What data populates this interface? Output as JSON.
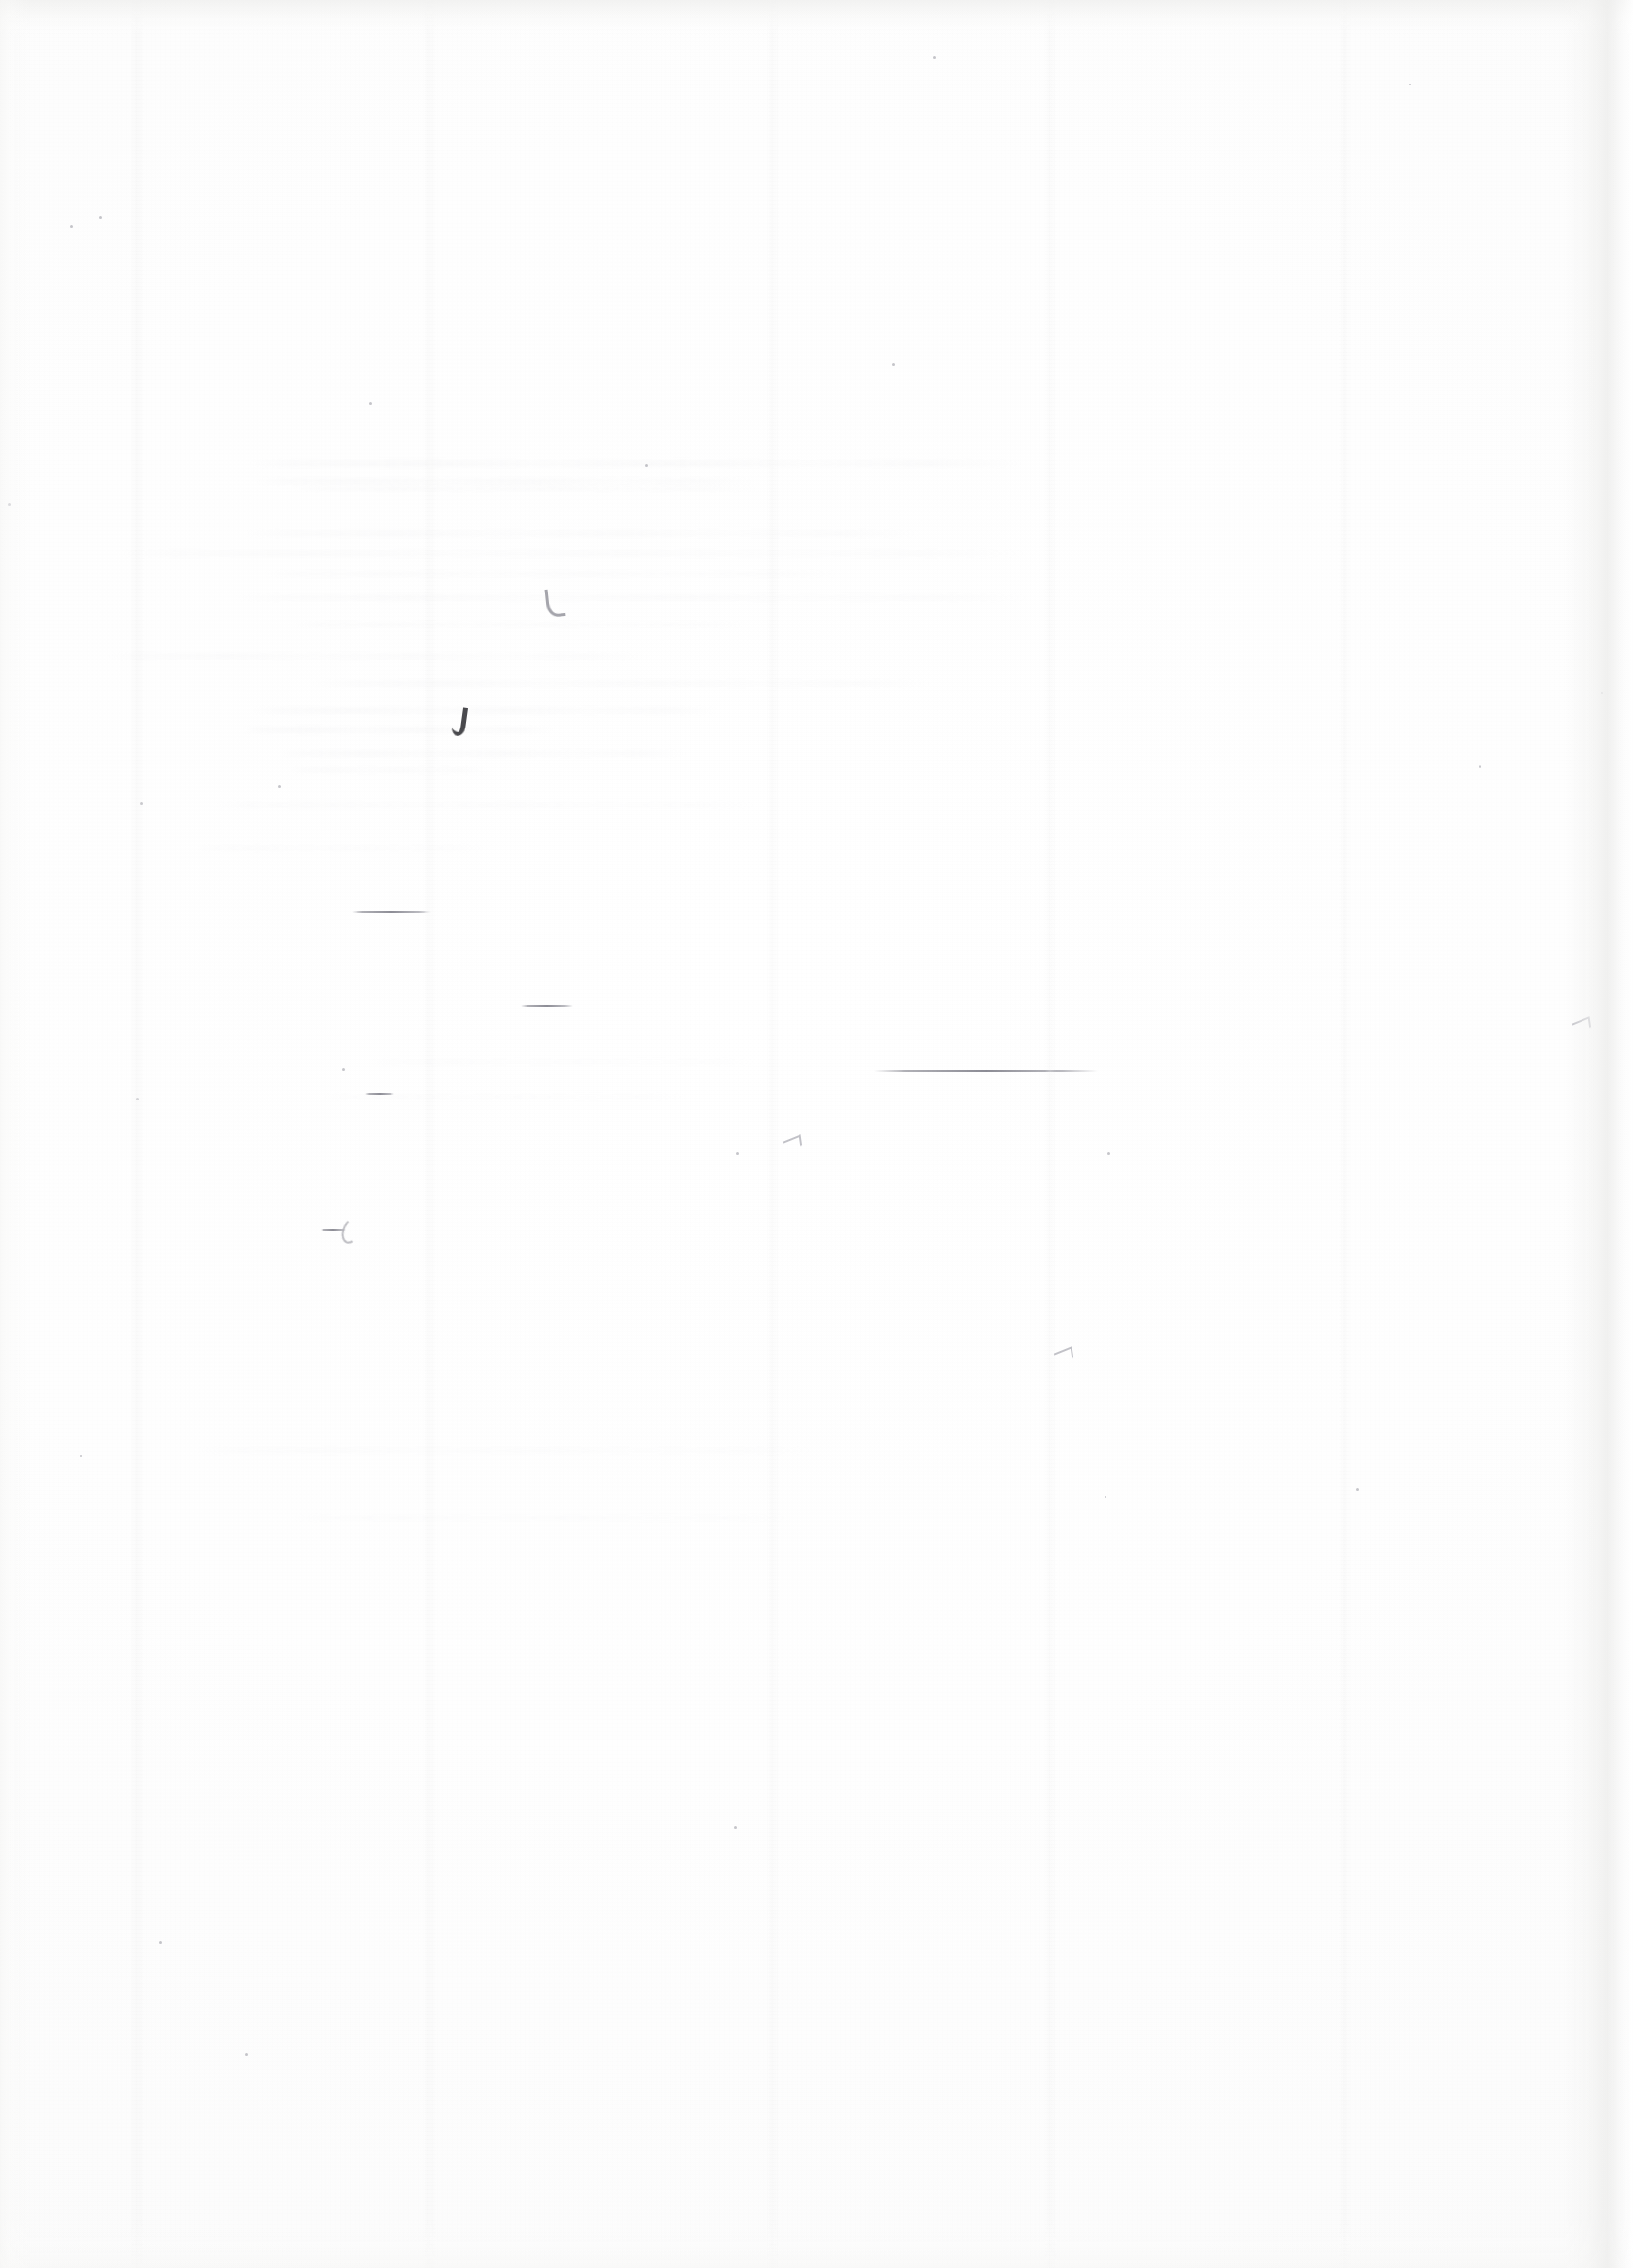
{
  "document": {
    "page_type": "blank-scanned-page",
    "visible_text": "",
    "description": "Blank scanned paper page with faint bleed-through ghosting and a few light pen marks",
    "background_color": "#fdfdfd",
    "paper_color": "#ffffff",
    "ink_color": "#3b3b3f",
    "ghost_color": "#dcdce0",
    "width_px": 1681,
    "height_px": 2335
  },
  "ghost_text": {
    "label": "bleed-through show-through from reverse side",
    "legible": "no",
    "lines": [
      {
        "x": 255,
        "y": 474,
        "w": 800,
        "h": 7,
        "op": 0.3
      },
      {
        "x": 262,
        "y": 492,
        "w": 520,
        "h": 7,
        "op": 0.26
      },
      {
        "x": 300,
        "y": 500,
        "w": 480,
        "h": 6,
        "op": 0.22
      },
      {
        "x": 250,
        "y": 546,
        "w": 700,
        "h": 7,
        "op": 0.24
      },
      {
        "x": 120,
        "y": 566,
        "w": 940,
        "h": 7,
        "op": 0.2
      },
      {
        "x": 270,
        "y": 588,
        "w": 600,
        "h": 6,
        "op": 0.18
      },
      {
        "x": 240,
        "y": 612,
        "w": 820,
        "h": 7,
        "op": 0.22
      },
      {
        "x": 300,
        "y": 640,
        "w": 470,
        "h": 6,
        "op": 0.18
      },
      {
        "x": 110,
        "y": 672,
        "w": 560,
        "h": 7,
        "op": 0.2
      },
      {
        "x": 320,
        "y": 700,
        "w": 640,
        "h": 7,
        "op": 0.24
      },
      {
        "x": 260,
        "y": 728,
        "w": 480,
        "h": 7,
        "op": 0.28
      },
      {
        "x": 250,
        "y": 748,
        "w": 320,
        "h": 7,
        "op": 0.3
      },
      {
        "x": 288,
        "y": 772,
        "w": 420,
        "h": 7,
        "op": 0.26
      },
      {
        "x": 300,
        "y": 790,
        "w": 200,
        "h": 6,
        "op": 0.22
      },
      {
        "x": 220,
        "y": 826,
        "w": 560,
        "h": 6,
        "op": 0.16
      },
      {
        "x": 200,
        "y": 870,
        "w": 300,
        "h": 6,
        "op": 0.14
      },
      {
        "x": 380,
        "y": 1090,
        "w": 400,
        "h": 6,
        "op": 0.12
      },
      {
        "x": 330,
        "y": 1126,
        "w": 380,
        "h": 6,
        "op": 0.12
      },
      {
        "x": 200,
        "y": 1490,
        "w": 640,
        "h": 7,
        "op": 0.14
      },
      {
        "x": 300,
        "y": 1560,
        "w": 520,
        "h": 6,
        "op": 0.12
      }
    ]
  },
  "marks": {
    "label": "hand-drawn / stray ink marks",
    "items": [
      {
        "name": "rule-short-upper",
        "x": 362,
        "y": 938,
        "w": 82,
        "type": "rule"
      },
      {
        "name": "rule-short-mid",
        "x": 536,
        "y": 1035,
        "w": 54,
        "type": "rule"
      },
      {
        "name": "rule-long-right",
        "x": 900,
        "y": 1102,
        "w": 230,
        "type": "rule"
      },
      {
        "name": "rule-micro-left",
        "x": 330,
        "y": 1265,
        "w": 26,
        "type": "rule"
      },
      {
        "name": "rule-micro-upper",
        "x": 376,
        "y": 1125,
        "w": 30,
        "type": "rule"
      },
      {
        "name": "comma-stroke",
        "x": 466,
        "y": 728,
        "type": "comma"
      },
      {
        "name": "hook-stroke",
        "x": 562,
        "y": 606,
        "type": "hook"
      },
      {
        "name": "curl-stroke",
        "x": 352,
        "y": 1255,
        "type": "curl"
      },
      {
        "name": "tick-stroke-right",
        "x": 1618,
        "y": 1050,
        "type": "tick"
      },
      {
        "name": "tick-stroke-mid",
        "x": 806,
        "y": 1172,
        "type": "tick"
      },
      {
        "name": "caret-stroke",
        "x": 1085,
        "y": 1390,
        "type": "tick"
      }
    ]
  },
  "specks": {
    "label": "scanner dust specks",
    "items": [
      {
        "x": 72,
        "y": 232,
        "d": 3
      },
      {
        "x": 102,
        "y": 222,
        "d": 3
      },
      {
        "x": 960,
        "y": 58,
        "d": 3
      },
      {
        "x": 918,
        "y": 374,
        "d": 3
      },
      {
        "x": 1450,
        "y": 86,
        "d": 2
      },
      {
        "x": 380,
        "y": 414,
        "d": 3
      },
      {
        "x": 664,
        "y": 478,
        "d": 3
      },
      {
        "x": 8,
        "y": 518,
        "d": 3
      },
      {
        "x": 1522,
        "y": 788,
        "d": 3
      },
      {
        "x": 286,
        "y": 808,
        "d": 3
      },
      {
        "x": 144,
        "y": 826,
        "d": 3
      },
      {
        "x": 140,
        "y": 1130,
        "d": 3
      },
      {
        "x": 352,
        "y": 1100,
        "d": 3
      },
      {
        "x": 758,
        "y": 1186,
        "d": 3
      },
      {
        "x": 1140,
        "y": 1186,
        "d": 3
      },
      {
        "x": 756,
        "y": 1880,
        "d": 3
      },
      {
        "x": 164,
        "y": 1998,
        "d": 3
      },
      {
        "x": 1396,
        "y": 1532,
        "d": 3
      },
      {
        "x": 1137,
        "y": 1540,
        "d": 2
      },
      {
        "x": 252,
        "y": 2114,
        "d": 3
      },
      {
        "x": 82,
        "y": 1498,
        "d": 2
      },
      {
        "x": 1648,
        "y": 712,
        "d": 2
      }
    ]
  }
}
